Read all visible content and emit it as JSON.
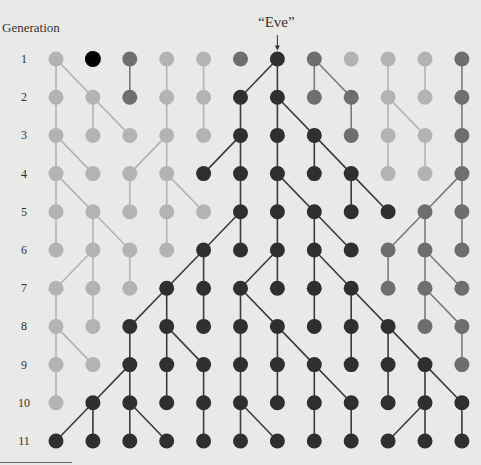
{
  "title": "Generation",
  "eve_label": "“Eve”",
  "colors": {
    "background": "#e9e9e7",
    "light": "#b3b3b1",
    "medium": "#6e6e6e",
    "dark": "#2f2f2f",
    "highlight": "#000000"
  },
  "generations": [
    "1",
    "2",
    "3",
    "4",
    "5",
    "6",
    "7",
    "8",
    "9",
    "10",
    "11"
  ],
  "columns": 12,
  "eve": {
    "gen": 1,
    "col": 6
  },
  "nodes": [
    "LHMLLMDMLLLM",
    "LLMLLDDMMLLM",
    "LLLLLDDDMLLM",
    "LLLLDDDDDLLM",
    "LLLLLDDDDDMM",
    "LLLLDDDDDMMM",
    "LLLDDDDDDMMM",
    "LLDDDDDDDDMM",
    "LLDDDDDDDDDM",
    "LDDDDDDDDDDD",
    "DDDDDDDDDDDD"
  ],
  "edges": [
    [
      [
        0,
        0
      ],
      [
        0,
        1
      ],
      [
        2,
        2
      ],
      [
        3,
        3
      ],
      [
        4,
        4
      ],
      [
        6,
        5
      ],
      [
        6,
        6
      ],
      [
        7,
        7
      ],
      [
        7,
        8
      ],
      [
        9,
        9
      ],
      [
        10,
        10
      ],
      [
        11,
        11
      ]
    ],
    [
      [
        0,
        0
      ],
      [
        1,
        1
      ],
      [
        1,
        2
      ],
      [
        3,
        3
      ],
      [
        4,
        4
      ],
      [
        5,
        5
      ],
      [
        6,
        6
      ],
      [
        6,
        7
      ],
      [
        8,
        8
      ],
      [
        9,
        9
      ],
      [
        9,
        10
      ],
      [
        11,
        11
      ]
    ],
    [
      [
        0,
        0
      ],
      [
        0,
        1
      ],
      [
        3,
        3
      ],
      [
        3,
        2
      ],
      [
        5,
        5
      ],
      [
        5,
        4
      ],
      [
        6,
        6
      ],
      [
        7,
        7
      ],
      [
        7,
        8
      ],
      [
        9,
        9
      ],
      [
        10,
        10
      ],
      [
        11,
        11
      ]
    ],
    [
      [
        0,
        0
      ],
      [
        0,
        1
      ],
      [
        2,
        2
      ],
      [
        3,
        3
      ],
      [
        3,
        4
      ],
      [
        5,
        5
      ],
      [
        6,
        6
      ],
      [
        6,
        7
      ],
      [
        8,
        8
      ],
      [
        8,
        9
      ],
      [
        11,
        10
      ],
      [
        11,
        11
      ]
    ],
    [
      [
        0,
        0
      ],
      [
        1,
        1
      ],
      [
        1,
        2
      ],
      [
        3,
        3
      ],
      [
        5,
        5
      ],
      [
        5,
        4
      ],
      [
        6,
        6
      ],
      [
        7,
        7
      ],
      [
        7,
        8
      ],
      [
        10,
        9
      ],
      [
        10,
        10
      ],
      [
        11,
        11
      ]
    ],
    [
      [
        1,
        0
      ],
      [
        1,
        1
      ],
      [
        2,
        2
      ],
      [
        4,
        4
      ],
      [
        4,
        3
      ],
      [
        6,
        6
      ],
      [
        6,
        5
      ],
      [
        7,
        7
      ],
      [
        7,
        8
      ],
      [
        9,
        9
      ],
      [
        10,
        10
      ],
      [
        10,
        11
      ]
    ],
    [
      [
        0,
        0
      ],
      [
        1,
        1
      ],
      [
        3,
        3
      ],
      [
        3,
        2
      ],
      [
        4,
        4
      ],
      [
        5,
        5
      ],
      [
        5,
        6
      ],
      [
        7,
        7
      ],
      [
        8,
        8
      ],
      [
        8,
        9
      ],
      [
        10,
        10
      ],
      [
        10,
        11
      ]
    ],
    [
      [
        0,
        0
      ],
      [
        0,
        1
      ],
      [
        2,
        2
      ],
      [
        3,
        3
      ],
      [
        3,
        4
      ],
      [
        5,
        5
      ],
      [
        6,
        6
      ],
      [
        6,
        7
      ],
      [
        8,
        8
      ],
      [
        9,
        9
      ],
      [
        9,
        10
      ],
      [
        11,
        11
      ]
    ],
    [
      [
        0,
        0
      ],
      [
        2,
        2
      ],
      [
        2,
        1
      ],
      [
        3,
        3
      ],
      [
        4,
        4
      ],
      [
        5,
        5
      ],
      [
        6,
        6
      ],
      [
        7,
        7
      ],
      [
        7,
        8
      ],
      [
        9,
        9
      ],
      [
        10,
        10
      ],
      [
        10,
        11
      ]
    ],
    [
      [
        1,
        0
      ],
      [
        1,
        1
      ],
      [
        2,
        2
      ],
      [
        2,
        3
      ],
      [
        4,
        4
      ],
      [
        5,
        5
      ],
      [
        5,
        6
      ],
      [
        7,
        7
      ],
      [
        8,
        8
      ],
      [
        10,
        10
      ],
      [
        10,
        9
      ],
      [
        11,
        11
      ]
    ]
  ]
}
